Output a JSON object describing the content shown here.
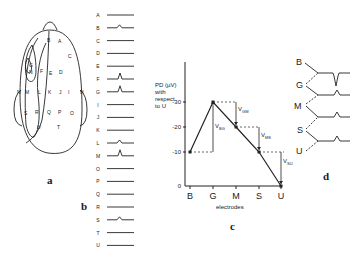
{
  "panels": {
    "a": {
      "label": "a",
      "electrodes": [
        "A",
        "B",
        "C",
        "D",
        "E",
        "F",
        "G",
        "H",
        "I",
        "J",
        "K",
        "L",
        "M",
        "N",
        "O",
        "P",
        "Q",
        "R",
        "S",
        "T",
        "U"
      ]
    },
    "b": {
      "label": "b",
      "traces": [
        {
          "label": "A",
          "peak": false
        },
        {
          "label": "B",
          "peak": "small"
        },
        {
          "label": "C",
          "peak": false
        },
        {
          "label": "D",
          "peak": false
        },
        {
          "label": "E",
          "peak": false
        },
        {
          "label": "F",
          "peak": "large"
        },
        {
          "label": "G",
          "peak": "large"
        },
        {
          "label": "I",
          "peak": false
        },
        {
          "label": "J",
          "peak": false
        },
        {
          "label": "K",
          "peak": false
        },
        {
          "label": "L",
          "peak": "small"
        },
        {
          "label": "M",
          "peak": "large"
        },
        {
          "label": "O",
          "peak": false
        },
        {
          "label": "P",
          "peak": false
        },
        {
          "label": "Q",
          "peak": false
        },
        {
          "label": "R",
          "peak": false
        },
        {
          "label": "S",
          "peak": "small"
        },
        {
          "label": "T",
          "peak": false
        },
        {
          "label": "U",
          "peak": false
        }
      ]
    },
    "c": {
      "label": "c",
      "ylabel_lines": [
        "PD (µV)",
        "with",
        "respect",
        "to U"
      ],
      "xlabel": "electrodes",
      "yticks": [
        "-30",
        "-20",
        "-10",
        "0"
      ],
      "xticks": [
        "B",
        "G",
        "M",
        "S",
        "U"
      ],
      "annotations": [
        "V",
        "BG",
        "V",
        "GM",
        "V",
        "MS",
        "V",
        "SU"
      ]
    },
    "d": {
      "label": "d",
      "electrodes": [
        "B",
        "G",
        "M",
        "S",
        "U"
      ]
    }
  },
  "chart_data": {
    "type": "line",
    "title": "",
    "xlabel": "electrodes",
    "ylabel": "PD (µV) with respect to U",
    "categories": [
      "B",
      "G",
      "M",
      "S",
      "U"
    ],
    "series": [
      {
        "name": "PD",
        "values": [
          -10,
          -30,
          -20,
          -10,
          0
        ]
      }
    ],
    "ylim": [
      0,
      -35
    ],
    "yticks": [
      0,
      -10,
      -20,
      -30
    ],
    "annotations": [
      {
        "text": "V_BG",
        "between": [
          "B",
          "G"
        ]
      },
      {
        "text": "V_GM",
        "between": [
          "G",
          "M"
        ]
      },
      {
        "text": "V_MS",
        "between": [
          "M",
          "S"
        ]
      },
      {
        "text": "V_SU",
        "between": [
          "S",
          "U"
        ]
      }
    ],
    "grid": false,
    "legend": "none"
  }
}
